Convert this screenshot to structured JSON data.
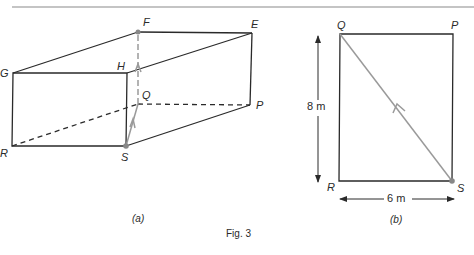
{
  "figure": {
    "caption": "Fig. 3",
    "panel_a": {
      "caption": "(a)",
      "vertices": {
        "F": "F",
        "E": "E",
        "G": "G",
        "H": "H",
        "Q": "Q",
        "P": "P",
        "R": "R",
        "S": "S"
      }
    },
    "panel_b": {
      "caption": "(b)",
      "vertices": {
        "Q": "Q",
        "P": "P",
        "R": "R",
        "S": "S"
      },
      "height_label": "8 m",
      "width_label": "6 m"
    }
  },
  "colors": {
    "line": "#2a2a2a",
    "path": "#9a9a9a",
    "rule": "#8a8a8a"
  }
}
